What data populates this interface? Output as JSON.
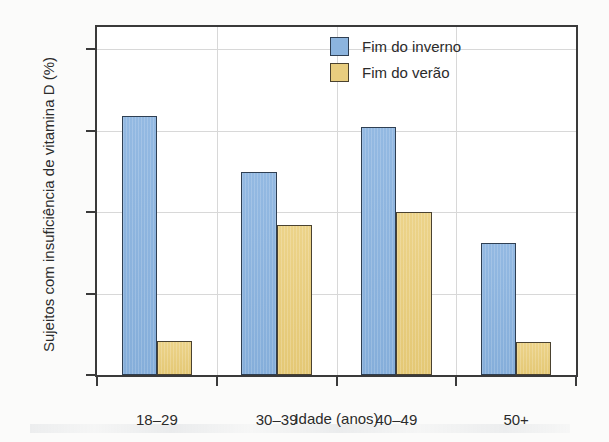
{
  "chart_data": {
    "type": "bar",
    "title": "",
    "xlabel": "Idade (anos)",
    "ylabel": "Sujeitos com insuficiência de vitamina D (%)",
    "categories": [
      "18–29",
      "30–39",
      "40–49",
      "50+"
    ],
    "series": [
      {
        "name": "Fim do inverno",
        "color": "#8cb4de",
        "values": [
          31.8,
          24.9,
          30.4,
          16.2
        ]
      },
      {
        "name": "Fim do verão",
        "color": "#e8cd7f",
        "values": [
          4.2,
          18.4,
          20.0,
          4.0
        ]
      }
    ],
    "ylim": [
      0,
      42.7
    ],
    "yticks": [
      0,
      10,
      20,
      30,
      40
    ],
    "ytick_labels": [
      "0",
      "10",
      "20",
      "30",
      "40"
    ],
    "grid": true,
    "legend_position": "top-right"
  },
  "legend": {
    "items": [
      {
        "label": "Fim do inverno"
      },
      {
        "label": "Fim do verão"
      }
    ]
  }
}
